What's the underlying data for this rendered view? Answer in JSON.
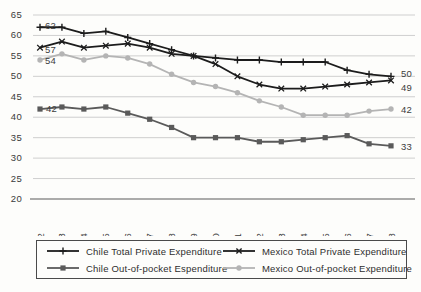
{
  "chart_data": {
    "type": "line",
    "title": "",
    "xlabel": "",
    "ylabel": "",
    "categories": [
      "2002",
      "2003",
      "2004",
      "2005",
      "2006",
      "2007",
      "2008",
      "2009",
      "2010",
      "2011",
      "2012",
      "2013",
      "2014",
      "2015",
      "2016",
      "2017",
      "2018"
    ],
    "ylim": [
      20,
      65
    ],
    "y_ticks": [
      20,
      25,
      30,
      35,
      40,
      45,
      50,
      55,
      60,
      65
    ],
    "grid": "horizontal-only",
    "legend_position": "bottom-boxed-2x2",
    "axis_color": "#8f8f8f",
    "gridline_color": "#c9c9c9",
    "tick_label_color": "#3a3a3a",
    "data_label_color": "#3c3c3c",
    "series": [
      {
        "name": "Chile Total Private Expenditure",
        "marker": "plus",
        "color": "#1c1c1c",
        "values": [
          62,
          62,
          60.5,
          61,
          59.5,
          58,
          56.5,
          55,
          54.5,
          54,
          54,
          53.5,
          53.5,
          53.5,
          51.5,
          50.5,
          50
        ],
        "start_label": "62",
        "end_label": "50"
      },
      {
        "name": "Mexico Total Private Expenditure",
        "marker": "x",
        "color": "#1c1c1c",
        "values": [
          57,
          58.5,
          57,
          57.5,
          58,
          57,
          55.5,
          55,
          53,
          50,
          48,
          47,
          47,
          47.5,
          48,
          48.5,
          49
        ],
        "start_label": "57",
        "end_label": "49"
      },
      {
        "name": "Chile Out-of-pocket Espenditure",
        "marker": "square",
        "color": "#5a5a5a",
        "values": [
          42,
          42.5,
          42,
          42.5,
          41,
          39.5,
          37.5,
          35,
          35,
          35,
          34,
          34,
          34.5,
          35,
          35.5,
          33.5,
          33
        ],
        "start_label": "42",
        "end_label": "33"
      },
      {
        "name": "Mexico Out-of-pocket Expenditure",
        "marker": "circle",
        "color": "#b4b4b4",
        "values": [
          54,
          55.5,
          54,
          55,
          54.5,
          53,
          50.5,
          48.5,
          47.5,
          46,
          44,
          42.5,
          40.5,
          40.5,
          40.5,
          41.5,
          42
        ],
        "start_label": "54",
        "end_label": "42"
      }
    ]
  }
}
